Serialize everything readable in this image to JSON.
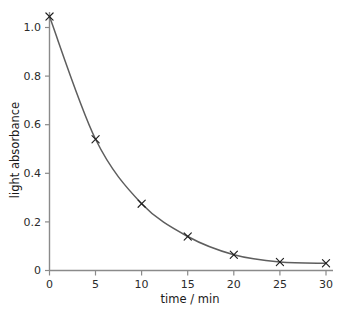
{
  "chart_data": {
    "type": "line",
    "title": "",
    "subtitle": "",
    "xlabel": "time / min",
    "ylabel": "light absorbance",
    "xlim": [
      0,
      31.5
    ],
    "ylim": [
      0,
      1.1
    ],
    "grid": false,
    "legend": null,
    "legend_position": "none",
    "marker": "x",
    "line_color": "#5e5e5e",
    "marker_color": "#1f1f1f",
    "axis_color": "#8a8a8a",
    "background_color": "#ffffff",
    "x": [
      0,
      5,
      10,
      15,
      20,
      25,
      30
    ],
    "values": [
      1.045,
      0.54,
      0.275,
      0.14,
      0.065,
      0.035,
      0.03
    ],
    "series": [
      {
        "name": "light absorbance",
        "x": [
          0,
          5,
          10,
          15,
          20,
          25,
          30
        ],
        "values": [
          1.045,
          0.54,
          0.275,
          0.14,
          0.065,
          0.035,
          0.03
        ]
      }
    ],
    "xticks": [
      0,
      5,
      10,
      15,
      20,
      25,
      30
    ],
    "xtick_labels": [
      "0",
      "5",
      "10",
      "15",
      "20",
      "25",
      "30"
    ],
    "yticks": [
      0,
      0.2,
      0.4,
      0.6,
      0.8,
      1.0
    ],
    "ytick_labels": [
      "0",
      "0.2",
      "0.4",
      "0.6",
      "0.8",
      "1.0"
    ],
    "annotations": []
  },
  "axes": {
    "x_title": "time / min",
    "y_title": "light absorbance"
  },
  "xtick": {
    "t0": "0",
    "t1": "5",
    "t2": "10",
    "t3": "15",
    "t4": "20",
    "t5": "25",
    "t6": "30"
  },
  "ytick": {
    "v0": "0",
    "v1": "0.2",
    "v2": "0.4",
    "v3": "0.6",
    "v4": "0.8",
    "v5": "1.0"
  }
}
